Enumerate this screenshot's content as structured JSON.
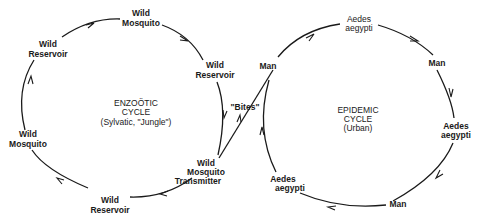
{
  "diagram": {
    "enzootic": {
      "title": "ENZOÖTIC",
      "subtitle": "CYCLE",
      "note": "(Sylvatic, \"Jungle\")",
      "nodes": [
        {
          "line1": "Wild",
          "line2": "Mosquito"
        },
        {
          "line1": "Wild",
          "line2": "Reservoir"
        },
        {
          "line1": "Wild",
          "line2": "Mosquito",
          "line3": "Transmitter"
        },
        {
          "line1": "Wild",
          "line2": "Reservoir"
        },
        {
          "line1": "Wild",
          "line2": "Mosquito"
        },
        {
          "line1": "Wild",
          "line2": "Reservoir"
        }
      ]
    },
    "link": {
      "label": "\"Bites\""
    },
    "epidemic": {
      "title": "EPIDEMIC",
      "subtitle": "CYCLE",
      "note": "(Urban)",
      "nodes": [
        {
          "line1": "Aedes",
          "line2": "aegypti"
        },
        {
          "line1": "Man"
        },
        {
          "line1": "Aedes",
          "line2": "aegypti"
        },
        {
          "line1": "Man"
        },
        {
          "line1": "Aedes",
          "line2": "aegypti"
        },
        {
          "line1": "Man"
        }
      ]
    },
    "colors": {
      "ink": "#1a1a1a",
      "background": "#ffffff"
    }
  }
}
